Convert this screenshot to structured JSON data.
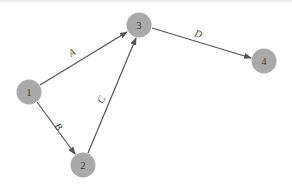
{
  "diagram": {
    "type": "directed-graph",
    "node_color": "#a9a9a9",
    "edge_color": "#555555",
    "nodes": [
      {
        "id": "1",
        "label": "1",
        "x": 29,
        "y": 92
      },
      {
        "id": "2",
        "label": "2",
        "x": 83,
        "y": 165
      },
      {
        "id": "3",
        "label": "3",
        "x": 139,
        "y": 25
      },
      {
        "id": "4",
        "label": "4",
        "x": 264,
        "y": 61
      }
    ],
    "edges": [
      {
        "from": "1",
        "to": "3",
        "label": "A"
      },
      {
        "from": "1",
        "to": "2",
        "label": "B"
      },
      {
        "from": "2",
        "to": "3",
        "label": "C"
      },
      {
        "from": "3",
        "to": "4",
        "label": "D"
      }
    ]
  }
}
